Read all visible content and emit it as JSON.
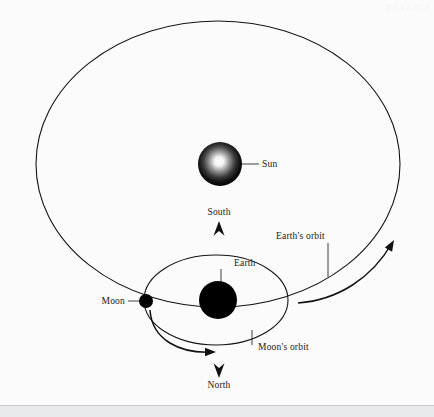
{
  "figure": {
    "kind": "astronomy-orbit-diagram",
    "background_color": "#fbfbfb",
    "line_color": "#141414",
    "text_color": "#1a1a1a",
    "watermark_text": "PHYSICS"
  },
  "bodies": [
    {
      "id": "sun",
      "label": "Sun",
      "style": "radial-gradient-sphere",
      "center_x": 220,
      "center_y": 164,
      "radius": 22,
      "fill_center_color": "#ffffff",
      "fill_edge_color": "#000000",
      "label_x": 262,
      "label_y": 167,
      "leader_from_x": 242,
      "leader_from_y": 164,
      "leader_to_x": 259,
      "leader_to_y": 164
    },
    {
      "id": "earth",
      "label": "Earth",
      "style": "solid-disc",
      "center_x": 218,
      "center_y": 300,
      "radius": 19,
      "fill_center_color": "#000000",
      "fill_edge_color": "#000000",
      "label_x": 234,
      "label_y": 266,
      "leader_from_x": 221,
      "leader_from_y": 281,
      "leader_to_x": 221,
      "leader_to_y": 269
    },
    {
      "id": "moon",
      "label": "Moon",
      "style": "solid-disc",
      "center_x": 146,
      "center_y": 301,
      "radius": 7,
      "fill_center_color": "#000000",
      "fill_edge_color": "#000000",
      "label_x": 125,
      "label_y": 304,
      "leader_from_x": 139,
      "leader_from_y": 301,
      "leader_to_x": 128,
      "leader_to_y": 301
    }
  ],
  "orbits": [
    {
      "id": "earth-orbit",
      "label": "Earth's orbit",
      "center_x": 218,
      "center_y": 164,
      "radius_x": 182,
      "radius_y": 143,
      "label_x": 276,
      "label_y": 239,
      "leader_from_x": 328,
      "leader_from_y": 243,
      "leader_to_x": 328,
      "leader_to_y": 277
    },
    {
      "id": "moon-orbit",
      "label": "Moon's orbit",
      "center_x": 216,
      "center_y": 300,
      "radius_x": 72,
      "radius_y": 45,
      "label_x": 258,
      "label_y": 350,
      "leader_from_x": 252,
      "leader_from_y": 345,
      "leader_to_x": 252,
      "leader_to_y": 330
    }
  ],
  "direction_markers": [
    {
      "id": "south",
      "label": "South",
      "arrow_direction": "up",
      "label_x": 219,
      "label_y": 215,
      "arrow_x": 219,
      "arrow_y": 232
    },
    {
      "id": "north",
      "label": "North",
      "arrow_direction": "down",
      "label_x": 219,
      "label_y": 388,
      "arrow_x": 219,
      "arrow_y": 367
    }
  ],
  "motion_arrows": [
    {
      "id": "earth-revolution-arrow",
      "describes": "Earth's direction of revolution around the Sun",
      "path": "M 298 303 C 338 300 372 278 392 243",
      "arrowhead_x": 394,
      "arrowhead_y": 240,
      "arrowhead_angle_deg": -60
    },
    {
      "id": "moon-revolution-arrow",
      "describes": "Moon's direction of revolution around the Earth",
      "path": "M 150 310 C 152 340 180 354 213 352",
      "arrowhead_x": 216,
      "arrowhead_y": 352,
      "arrowhead_angle_deg": 0
    }
  ]
}
